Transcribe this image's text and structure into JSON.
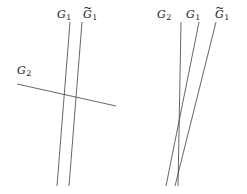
{
  "figure": {
    "caption": "",
    "background_color": "#ffffff",
    "line_color": "#3f3f3f",
    "text_color": "#1a1a1a",
    "width": 247,
    "height": 194,
    "panels": [
      {
        "id": "left-panel",
        "name": "transversal-configuration",
        "labels": [
          {
            "id": "left-G1",
            "base": "G",
            "sub": "1",
            "tilde": false,
            "text": "G1",
            "x": 57,
            "y": 9
          },
          {
            "id": "left-G1-tilde",
            "base": "G",
            "sub": "1",
            "tilde": true,
            "text": "G̃1",
            "x": 83,
            "y": 9
          },
          {
            "id": "left-G2",
            "base": "G",
            "sub": "2",
            "tilde": false,
            "text": "G2",
            "x": 17,
            "y": 65
          }
        ],
        "lines": [
          {
            "id": "left-line-G1",
            "label": "G1",
            "x1": 70,
            "y1": 22,
            "x2": 57,
            "y2": 186
          },
          {
            "id": "left-line-G1-tilde",
            "label": "G̃1",
            "x1": 82,
            "y1": 22,
            "x2": 69,
            "y2": 186
          },
          {
            "id": "left-line-G2",
            "label": "G2",
            "x1": 17,
            "y1": 84,
            "x2": 116,
            "y2": 106
          }
        ]
      },
      {
        "id": "right-panel",
        "name": "tangential-configuration",
        "labels": [
          {
            "id": "right-G2",
            "base": "G",
            "sub": "2",
            "tilde": false,
            "text": "G2",
            "x": 157,
            "y": 9
          },
          {
            "id": "right-G1",
            "base": "G",
            "sub": "1",
            "tilde": false,
            "text": "G1",
            "x": 186,
            "y": 9
          },
          {
            "id": "right-G1-tilde",
            "base": "G",
            "sub": "1",
            "tilde": true,
            "text": "G̃1",
            "x": 215,
            "y": 9
          }
        ],
        "lines": [
          {
            "id": "right-line-G2",
            "label": "G2",
            "x1": 181,
            "y1": 22,
            "x2": 178,
            "y2": 186
          },
          {
            "id": "right-line-G1",
            "label": "G1",
            "x1": 199,
            "y1": 22,
            "x2": 166,
            "y2": 186
          },
          {
            "id": "right-line-G1-tilde",
            "label": "G̃1",
            "x1": 216,
            "y1": 22,
            "x2": 175,
            "y2": 186
          }
        ]
      }
    ]
  }
}
